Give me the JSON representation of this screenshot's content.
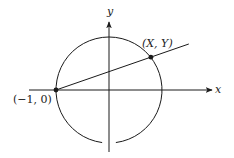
{
  "diagram": {
    "axes": {
      "x_label": "x",
      "y_label": "y"
    },
    "circle": {
      "center": [
        0,
        0
      ],
      "radius": 1
    },
    "points": [
      {
        "id": "left",
        "label": "(−1, 0)",
        "coords": [
          -1,
          0
        ]
      },
      {
        "id": "xy",
        "label": "(X, Y)",
        "coords": [
          0.79,
          0.62
        ]
      }
    ],
    "line": {
      "through": [
        "left",
        "xy"
      ]
    },
    "colors": {
      "ink": "#1a1a1a",
      "background": "#ffffff"
    }
  }
}
